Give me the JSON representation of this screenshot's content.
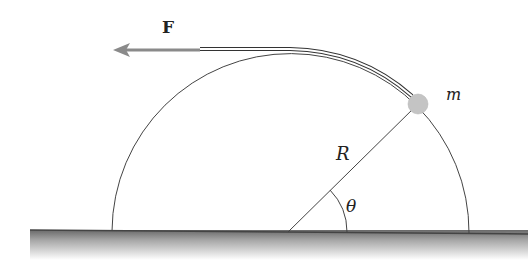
{
  "diagram": {
    "labels": {
      "force": "F",
      "mass": "m",
      "radius": "R",
      "angle": "θ"
    },
    "geometry": {
      "center": [
        288,
        232
      ],
      "radius": 178,
      "theta_deg": 40,
      "ball_radius": 10
    },
    "colors": {
      "ground_top": "#5a5a5a",
      "ground_fade": "#ffffff",
      "ball": "#c4c4c4",
      "arrow": "#8a8a8a",
      "line": "#444444"
    }
  }
}
